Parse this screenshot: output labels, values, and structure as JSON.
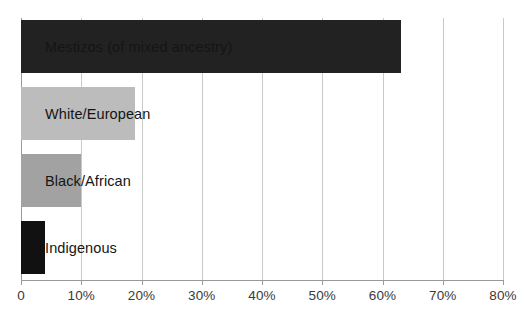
{
  "chart_data": {
    "type": "bar",
    "orientation": "horizontal",
    "title": "",
    "subtitle": "",
    "xlabel": "",
    "ylabel": "",
    "categories": [
      "Mestizos (of mixed ancestry)",
      "White/European",
      "Black/African",
      "Indigenous"
    ],
    "values": [
      63,
      19,
      10,
      4
    ],
    "value_unit": "%",
    "xlim": [
      0,
      80
    ],
    "xticks": [
      0,
      10,
      20,
      30,
      40,
      50,
      60,
      70,
      80
    ],
    "xtick_labels": [
      "0",
      "10%",
      "20%",
      "30%",
      "40%",
      "50%",
      "60%",
      "70%",
      "80%"
    ],
    "grid": "vertical",
    "legend": "none",
    "bar_colors": [
      "#222222",
      "#bcbcbc",
      "#a2a2a2",
      "#111111"
    ],
    "label_color": "#151515",
    "gridline_color": "#c9c9c9",
    "axis_color": "#9a9a9a",
    "background": "#ffffff",
    "series": [
      {
        "name": "Share of population",
        "points": [
          {
            "category": "Mestizos (of mixed ancestry)",
            "value": 63,
            "color": "#222222"
          },
          {
            "category": "White/European",
            "value": 19,
            "color": "#bcbcbc"
          },
          {
            "category": "Black/African",
            "value": 10,
            "color": "#a2a2a2"
          },
          {
            "category": "Indigenous",
            "value": 4,
            "color": "#111111"
          }
        ]
      }
    ]
  }
}
